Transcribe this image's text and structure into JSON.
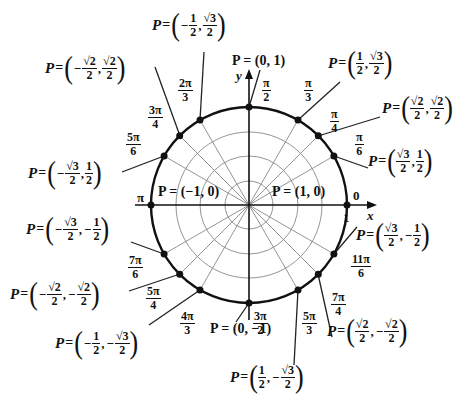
{
  "diagram": {
    "axes": {
      "x_label": "x",
      "y_label": "y",
      "tick_one": "1"
    },
    "circle": {
      "center_px": [
        249,
        205
      ],
      "radius_px": 98
    },
    "angles": [
      {
        "id": "0",
        "num": "0",
        "den": "",
        "point": "P = (1, 0)"
      },
      {
        "id": "pi6",
        "num": "π",
        "den": "6",
        "point": "P = (√3/2, 1/2)"
      },
      {
        "id": "pi4",
        "num": "π",
        "den": "4",
        "point": "P = (√2/2, √2/2)"
      },
      {
        "id": "pi3",
        "num": "π",
        "den": "3",
        "point": "P = (1/2, √3/2)"
      },
      {
        "id": "pi2",
        "num": "π",
        "den": "2",
        "point": "P = (0, 1)"
      },
      {
        "id": "2pi3",
        "num": "2π",
        "den": "3",
        "point": "P = (−1/2, √3/2)"
      },
      {
        "id": "3pi4",
        "num": "3π",
        "den": "4",
        "point": "P = (−√2/2, √2/2)"
      },
      {
        "id": "5pi6",
        "num": "5π",
        "den": "6",
        "point": "P = (−√3/2, 1/2)"
      },
      {
        "id": "pi",
        "num": "π",
        "den": "",
        "point": "P = (−1, 0)"
      },
      {
        "id": "7pi6",
        "num": "7π",
        "den": "6",
        "point": "P = (−√3/2, −1/2)"
      },
      {
        "id": "5pi4",
        "num": "5π",
        "den": "4",
        "point": "P = (−√2/2, −√2/2)"
      },
      {
        "id": "4pi3",
        "num": "4π",
        "den": "3",
        "point": "P = (−1/2, −√3/2)"
      },
      {
        "id": "3pi2",
        "num": "3π",
        "den": "2",
        "point": "P = (0, −1)"
      },
      {
        "id": "5pi3",
        "num": "5π",
        "den": "3",
        "point": "P = (1/2, −√3/2)"
      },
      {
        "id": "7pi4",
        "num": "7π",
        "den": "4",
        "point": "P = (√2/2, −√2/2)"
      },
      {
        "id": "11pi6",
        "num": "11π",
        "den": "6",
        "point": "P = (√3/2, −1/2)"
      }
    ],
    "labels": {
      "P": "P",
      "eq": "=",
      "comma": ",",
      "minus": "−",
      "lparen": "(",
      "rparen": ")",
      "half_num": "1",
      "two": "2",
      "sqrt3": "√3",
      "sqrt2": "√2",
      "p_0_1": "P = (0, 1)",
      "p_0_m1": "P = (0, −1)",
      "p_m1_0": "P = (−1, 0)",
      "p_1_0": "P = (1, 0)"
    }
  }
}
